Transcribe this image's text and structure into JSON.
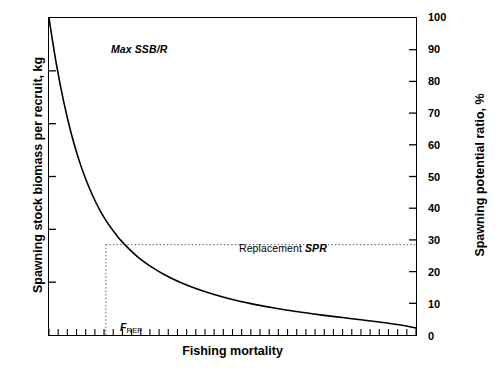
{
  "figure": {
    "background_color": "#ffffff",
    "line_color": "#000000"
  },
  "chart_data": {
    "type": "line",
    "title": "",
    "xlabel": "Fishing mortality",
    "ylabel_left": "Spawning stock biomass per recruit, kg",
    "ylabel_right": "Spawning potential ratio, %",
    "grid": false,
    "legend_position": "none",
    "xlim": [
      0,
      1
    ],
    "xticks_labeled": [],
    "left_axis": {
      "labeled_ticks": false,
      "tick_count": 6
    },
    "right_axis": {
      "ylim": [
        0,
        100
      ],
      "ticks": [
        0,
        10,
        20,
        30,
        40,
        50,
        60,
        70,
        80,
        90,
        100
      ],
      "tick_labels": [
        "0",
        "10",
        "20",
        "30",
        "40",
        "50",
        "60",
        "70",
        "80",
        "90",
        "100"
      ]
    },
    "series": [
      {
        "name": "Spawning potential ratio",
        "x": [
          0.0,
          0.02,
          0.04,
          0.06,
          0.08,
          0.1,
          0.12,
          0.14,
          0.16,
          0.18,
          0.2,
          0.24,
          0.28,
          0.32,
          0.36,
          0.4,
          0.45,
          0.5,
          0.55,
          0.6,
          0.65,
          0.7,
          0.75,
          0.8,
          0.85,
          0.9,
          0.95,
          1.0
        ],
        "values": [
          100.0,
          85.5,
          73.6,
          63.8,
          55.8,
          49.2,
          43.7,
          39.1,
          35.3,
          32.1,
          29.3,
          24.8,
          21.4,
          18.7,
          16.5,
          14.7,
          12.8,
          11.2,
          9.9,
          8.8,
          7.8,
          7.0,
          6.2,
          5.5,
          4.8,
          4.1,
          3.3,
          2.2
        ]
      }
    ],
    "annotations": [
      {
        "name": "max-ssbr",
        "text": "Max SSB/R",
        "x": 0.04,
        "y": 96
      },
      {
        "name": "replacement-spr",
        "text_plain": "Replacement ",
        "text_italic": "SPR",
        "x": 0.385,
        "y": 33
      },
      {
        "name": "f-rep",
        "text_base": "F",
        "text_sub": "REP",
        "x": 0.065,
        "y": 10
      }
    ],
    "reference_lines": [
      {
        "name": "replacement-spr-horizontal",
        "orientation": "horizontal",
        "value": 28.5,
        "style": "dotted",
        "from_x": 0.155,
        "to_x": 1.0
      },
      {
        "name": "f-rep-vertical",
        "orientation": "vertical",
        "value": 0.155,
        "style": "dotted",
        "from_y": 0,
        "to_y": 28.5
      }
    ]
  },
  "labels": {
    "xtitle": "Fishing mortality",
    "ytitle_left": "Spawning stock biomass per recruit, kg",
    "ytitle_right": "Spawning potential ratio, %",
    "max_ssbr": "Max SSB/R",
    "replacement_plain": "Replacement ",
    "replacement_italic": "SPR",
    "frep_base": "F",
    "frep_sub": "REP"
  }
}
